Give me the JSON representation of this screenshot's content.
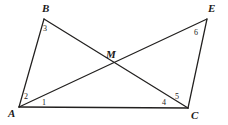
{
  "figure": {
    "background_color": "#ffffff",
    "line_color": "#22201f",
    "label_color": "#1c1a19",
    "canvas": {
      "width": 228,
      "height": 125
    },
    "points": {
      "A": {
        "x": 19,
        "y": 107
      },
      "B": {
        "x": 44,
        "y": 19
      },
      "C": {
        "x": 188,
        "y": 108
      },
      "E": {
        "x": 207,
        "y": 19
      },
      "M": {
        "x": 110,
        "y": 64
      }
    },
    "segments": [
      {
        "name": "segment-AB",
        "from": "A",
        "to": "B",
        "style": "thin"
      },
      {
        "name": "segment-AC",
        "from": "A",
        "to": "C",
        "style": "base"
      },
      {
        "name": "segment-AE",
        "from": "A",
        "to": "E",
        "style": "thin"
      },
      {
        "name": "segment-BC",
        "from": "B",
        "to": "C",
        "style": "thin"
      },
      {
        "name": "segment-CE",
        "from": "C",
        "to": "E",
        "style": "thin"
      }
    ],
    "vertex_labels": [
      {
        "name": "vertex-label-B",
        "text": "B",
        "x": 42,
        "y": 3
      },
      {
        "name": "vertex-label-E",
        "text": "E",
        "x": 208,
        "y": 3
      },
      {
        "name": "vertex-label-M",
        "text": "M",
        "x": 106,
        "y": 49
      },
      {
        "name": "vertex-label-A",
        "text": "A",
        "x": 8,
        "y": 108
      },
      {
        "name": "vertex-label-C",
        "text": "C",
        "x": 191,
        "y": 110
      }
    ],
    "angle_labels": [
      {
        "name": "angle-label-1",
        "text": "1",
        "x": 42,
        "y": 99
      },
      {
        "name": "angle-label-2",
        "text": "2",
        "x": 24,
        "y": 93
      },
      {
        "name": "angle-label-3",
        "text": "3",
        "x": 43,
        "y": 25
      },
      {
        "name": "angle-label-4",
        "text": "4",
        "x": 162,
        "y": 99
      },
      {
        "name": "angle-label-5",
        "text": "5",
        "x": 175,
        "y": 93
      },
      {
        "name": "angle-label-6",
        "text": "6",
        "x": 194,
        "y": 29
      }
    ]
  }
}
